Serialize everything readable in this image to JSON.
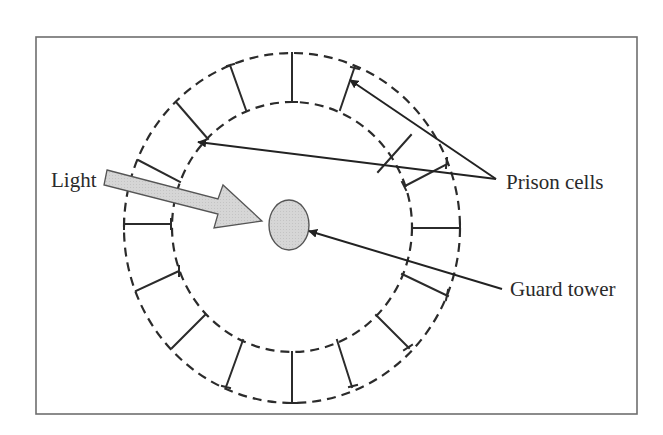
{
  "diagram": {
    "type": "panopticon",
    "labels": {
      "light": "Light",
      "prison_cells": "Prison cells",
      "guard_tower": "Guard tower"
    },
    "colors": {
      "stroke": "#2b2b2b",
      "frame": "#6e6e6e",
      "fill_gray": "#d3d3d3",
      "background": "#ffffff"
    },
    "elements": [
      {
        "id": "frame",
        "kind": "rectangle"
      },
      {
        "id": "outer-ring",
        "kind": "dashed-ellipse"
      },
      {
        "id": "inner-ring",
        "kind": "dashed-ellipse"
      },
      {
        "id": "cell-walls",
        "kind": "radial-segments",
        "count": 16
      },
      {
        "id": "guard-tower",
        "kind": "filled-ellipse",
        "label": "Guard tower"
      },
      {
        "id": "light-arrow",
        "kind": "block-arrow",
        "label": "Light"
      },
      {
        "id": "prison-cells-pointers",
        "kind": "arrows",
        "count": 2,
        "label": "Prison cells"
      },
      {
        "id": "guard-tower-pointer",
        "kind": "arrow",
        "label": "Guard tower"
      }
    ]
  }
}
